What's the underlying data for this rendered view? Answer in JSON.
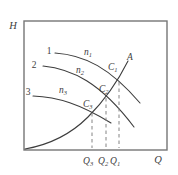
{
  "figure": {
    "title_semantic": "pump-characteristic-curves-diagram",
    "background": "#ffffff",
    "colors": {
      "frame": "#767676",
      "curve": "#3d3d3d",
      "dashed": "#848484",
      "text": "#3e3e3e"
    },
    "y_axis_label": "H",
    "x_axis_label": "Q",
    "system_curve_label": "A",
    "pump_curves": [
      {
        "index_label": "1",
        "speed": {
          "main": "n",
          "sub": "1"
        },
        "operating_point": {
          "main": "C",
          "sub": "1"
        },
        "flow_tick": {
          "main": "Q",
          "sub": "1"
        }
      },
      {
        "index_label": "2",
        "speed": {
          "main": "n",
          "sub": "2"
        },
        "operating_point": {
          "main": "C",
          "sub": "2"
        },
        "flow_tick": {
          "main": "Q",
          "sub": "2"
        }
      },
      {
        "index_label": "3",
        "speed": {
          "main": "n",
          "sub": "3"
        },
        "operating_point": {
          "main": "C",
          "sub": "3"
        },
        "flow_tick": {
          "main": "Q",
          "sub": "3"
        }
      }
    ]
  }
}
